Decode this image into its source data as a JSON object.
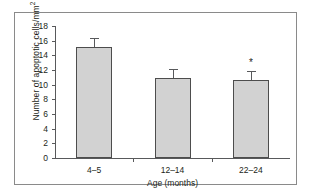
{
  "chart_data": {
    "type": "bar",
    "title": "",
    "xlabel": "Age (months)",
    "ylabel_prefix": "Number of apoptotic cells/mm",
    "ylabel_sup": "2",
    "categories": [
      "4–5",
      "12–14",
      "22–24"
    ],
    "values": [
      15.1,
      10.9,
      10.6
    ],
    "errors": [
      1.2,
      1.2,
      1.2
    ],
    "yticks": [
      "18",
      "16",
      "14",
      "12",
      "10",
      "8",
      "6",
      "4",
      "2",
      "0"
    ],
    "ytick_values": [
      18,
      16,
      14,
      12,
      10,
      8,
      6,
      4,
      2,
      0
    ],
    "ylim": [
      0,
      18
    ],
    "grid": false,
    "legend": false,
    "annotations": [
      {
        "category": "22–24",
        "text": "*"
      }
    ],
    "bar_color": "#d2d2d2",
    "bar_edge_color": "#4d4d4d",
    "axis_color": "#58595b",
    "text_color": "#231f20",
    "frame_color": "#8a8a8a"
  }
}
